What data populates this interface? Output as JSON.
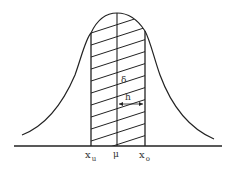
{
  "figure": {
    "type": "normal-distribution-diagram",
    "labels": {
      "lower_bound": "x",
      "lower_bound_sub": "u",
      "mean": "μ",
      "upper_bound": "x",
      "upper_bound_sub": "o",
      "sigma": "δ",
      "half_width": "h"
    },
    "colors": {
      "line": "#222222",
      "background": "#ffffff"
    }
  }
}
